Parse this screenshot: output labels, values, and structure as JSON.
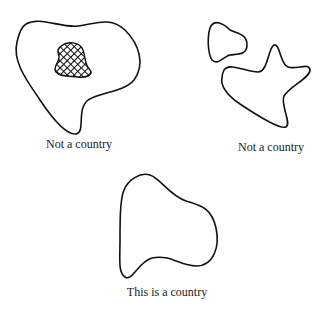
{
  "figures": [
    {
      "id": "enclave",
      "label": "Not a country",
      "description": "Region containing a hatched enclave"
    },
    {
      "id": "disconnected",
      "label": "Not a country",
      "description": "Two disconnected regions"
    },
    {
      "id": "connected",
      "label": "This is a country",
      "description": "Single connected region without holes"
    }
  ],
  "colors": {
    "stroke": "#111111",
    "background": "#ffffff"
  }
}
